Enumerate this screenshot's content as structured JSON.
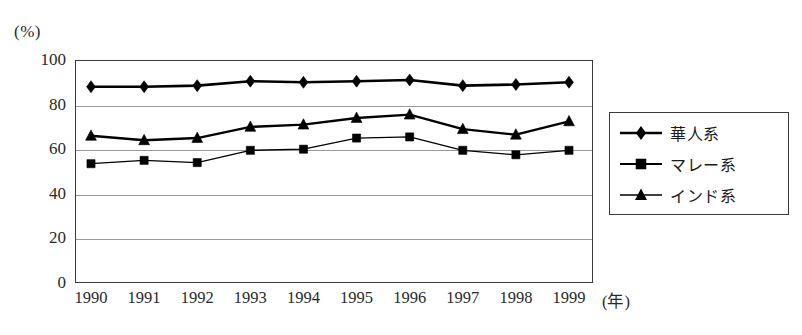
{
  "chart_data": {
    "type": "line",
    "title": "",
    "subtitle": "",
    "unit_label": "(%)",
    "xlabel": "(年)",
    "ylabel": "",
    "categories": [
      "1990",
      "1991",
      "1992",
      "1993",
      "1994",
      "1995",
      "1996",
      "1997",
      "1998",
      "1999"
    ],
    "x": [
      1990,
      1991,
      1992,
      1993,
      1994,
      1995,
      1996,
      1997,
      1998,
      1999
    ],
    "ylim": [
      0,
      100
    ],
    "yticks": [
      0,
      20,
      40,
      60,
      80,
      100
    ],
    "ytick_labels": [
      "0",
      "20",
      "40",
      "60",
      "80",
      "100"
    ],
    "grid": true,
    "grid_axis": "y",
    "legend_position": "right-outside",
    "series": [
      {
        "name": "華人系",
        "marker": "diamond",
        "color": "#000000",
        "values": [
          88,
          88,
          88.5,
          90.5,
          90,
          90.5,
          91,
          88.5,
          89,
          90
        ]
      },
      {
        "name": "マレー系",
        "marker": "square",
        "color": "#000000",
        "values": [
          53.5,
          55,
          54,
          59.5,
          60,
          65,
          65.5,
          59.5,
          57.5,
          59.5
        ]
      },
      {
        "name": "インド系",
        "marker": "triangle",
        "color": "#000000",
        "values": [
          66,
          64,
          65,
          70,
          71,
          74,
          75.5,
          69,
          66.5,
          72.5
        ]
      }
    ]
  },
  "legend": {
    "items": [
      {
        "label": "華人系",
        "marker": "diamond"
      },
      {
        "label": "マレー系",
        "marker": "square"
      },
      {
        "label": "インド系",
        "marker": "triangle"
      }
    ]
  }
}
